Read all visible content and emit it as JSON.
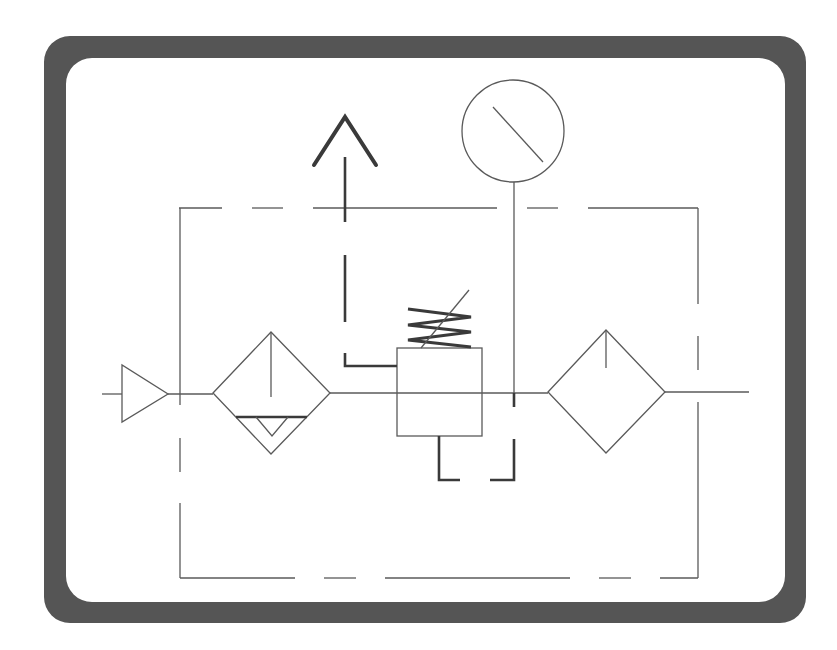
{
  "diagram": {
    "title": "Pneumatic FRL unit symbol (filter, regulator, gauge, lubricator)",
    "colors": {
      "frame": "#555555",
      "background": "#ffffff",
      "line": "#5a5a5a",
      "thick_line": "#3a3a3a"
    },
    "components": [
      {
        "id": "inlet",
        "label": "Inlet port / flow direction triangle"
      },
      {
        "id": "filter",
        "label": "Filter with manual drain"
      },
      {
        "id": "regulator",
        "label": "Pressure regulator with adjustable spring"
      },
      {
        "id": "gauge",
        "label": "Pressure gauge"
      },
      {
        "id": "exhaust",
        "label": "Exhaust / relief arrow"
      },
      {
        "id": "lubricator",
        "label": "Lubricator"
      },
      {
        "id": "outlet",
        "label": "Outlet port"
      },
      {
        "id": "enclosure",
        "label": "Combined unit enclosure (dashed boundary)"
      }
    ]
  }
}
